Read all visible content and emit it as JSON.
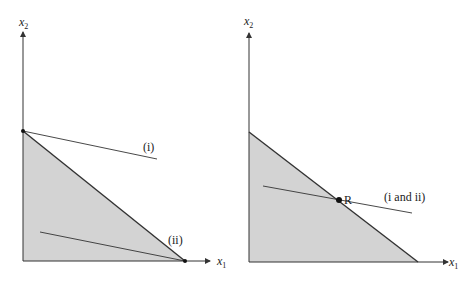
{
  "panels": [
    {
      "id": "left",
      "x_axis_label": "x",
      "x_axis_sub": "1",
      "y_axis_label": "x",
      "y_axis_sub": "2",
      "line_labels": [
        "(i)",
        "(ii)"
      ]
    },
    {
      "id": "right",
      "x_axis_label": "x",
      "x_axis_sub": "1",
      "y_axis_label": "x",
      "y_axis_sub": "2",
      "point_label": "R",
      "line_labels": [
        "(i and ii)"
      ]
    }
  ],
  "colors": {
    "feasible_region": "#d3d3d3",
    "lines": "#333333"
  }
}
